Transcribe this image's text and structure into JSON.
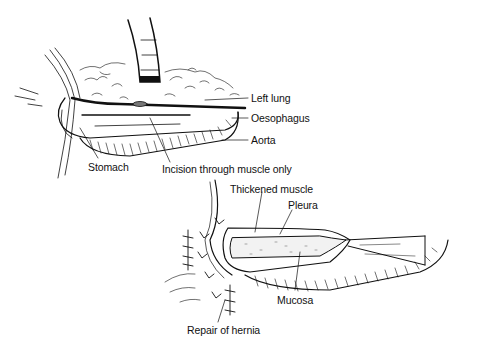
{
  "figure": {
    "panels": [
      {
        "id": "top",
        "description": "Left thoracotomy view: oesophagus exposed with incision through muscle only",
        "labels": {
          "left_lung": "Left lung",
          "oesophagus": "Oesophagus",
          "aorta": "Aorta",
          "stomach": "Stomach",
          "incision": "Incision through muscle only"
        }
      },
      {
        "id": "bottom",
        "description": "Myotomy completed exposing mucosa; hiatus hernia repaired",
        "labels": {
          "thickened_muscle": "Thickened muscle",
          "pleura": "Pleura",
          "mucosa": "Mucosa",
          "repair": "Repair of hernia"
        }
      }
    ],
    "colors": {
      "ink": "#111111",
      "background": "#ffffff"
    }
  }
}
